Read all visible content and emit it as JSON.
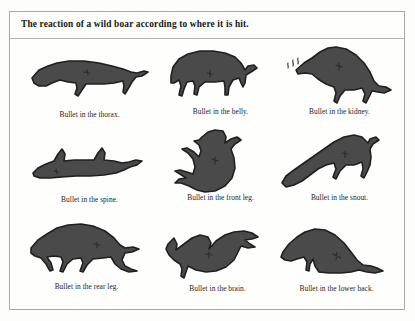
{
  "page": {
    "title": "The reaction of a wild boar according to where it is hit.",
    "background_color": "#fdfdfb",
    "plate_background_color": "#fefefd",
    "border_color": "#a8a8a8",
    "boar_fill_color": "#4a4a4a",
    "boar_outline_color": "#1f1f1f",
    "text_color": "#1d1d1d"
  },
  "panels": [
    {
      "id": "thorax",
      "caption": "Bullet in the thorax.",
      "pose": "standing-stretched-profile-facing-left",
      "row": 1,
      "column": 1
    },
    {
      "id": "belly",
      "caption": "Bullet in the belly.",
      "pose": "hunched-back-arched-standing-facing-left",
      "row": 1,
      "column": 2
    },
    {
      "id": "kidney",
      "caption": "Bullet in the kidney.",
      "pose": "lunging-forward-head-low-with-spray-marks",
      "row": 1,
      "column": 3
    },
    {
      "id": "spine",
      "caption": "Bullet in the spine.",
      "pose": "collapsed-flat-sprawled-on-ground",
      "row": 2,
      "column": 1
    },
    {
      "id": "front-leg",
      "caption": "Bullet in the front leg.",
      "pose": "tumbling-forward-somersault-head-down",
      "row": 2,
      "column": 2
    },
    {
      "id": "snout",
      "caption": "Bullet in the snout.",
      "pose": "nose-diving-front-end-lowered",
      "row": 2,
      "column": 3
    },
    {
      "id": "rear-leg",
      "caption": "Bullet in the rear leg.",
      "pose": "walking-with-rear-leg-dragging",
      "row": 3,
      "column": 1
    },
    {
      "id": "brain",
      "caption": "Bullet in the brain.",
      "pose": "crumpled-dropped-instantly-legs-splayed",
      "row": 3,
      "column": 2
    },
    {
      "id": "lower-back",
      "caption": "Bullet in the lower back.",
      "pose": "sitting-on-haunches-rear-end-down",
      "row": 3,
      "column": 3
    }
  ]
}
